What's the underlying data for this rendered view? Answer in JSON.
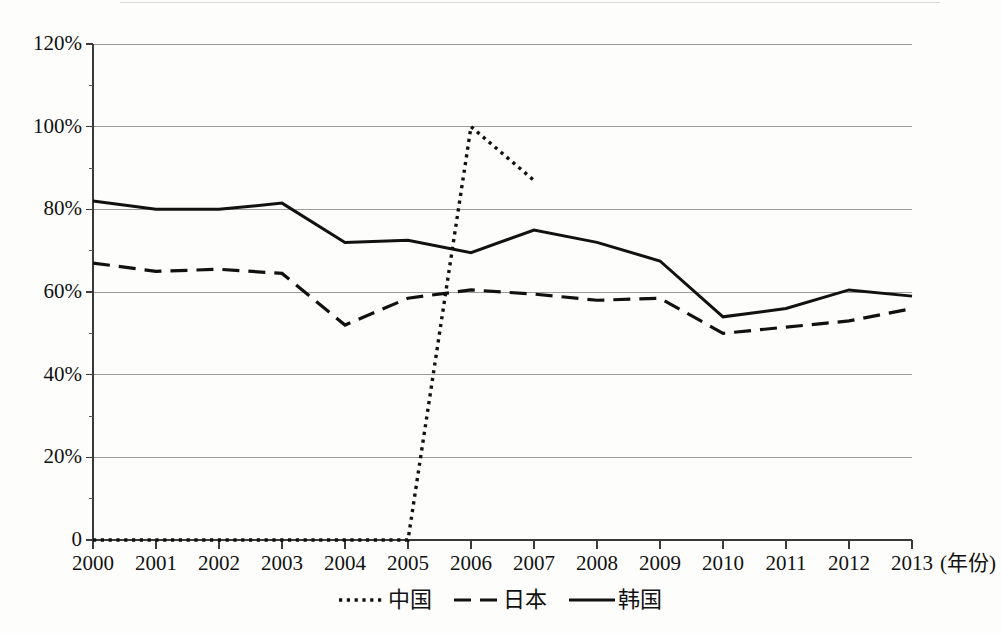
{
  "chart_data": {
    "type": "line",
    "title": "",
    "subtitle": "",
    "xlabel": "(年份)",
    "ylabel": "",
    "x": [
      2000,
      2001,
      2002,
      2003,
      2004,
      2005,
      2006,
      2007,
      2008,
      2009,
      2010,
      2011,
      2012,
      2013
    ],
    "categories": [
      "2000",
      "2001",
      "2002",
      "2003",
      "2004",
      "2005",
      "2006",
      "2007",
      "2008",
      "2009",
      "2010",
      "2011",
      "2012",
      "2013"
    ],
    "xlim": [
      2000,
      2013
    ],
    "ylim": [
      0,
      120
    ],
    "y_tick_labels": [
      "0",
      "20%",
      "40%",
      "60%",
      "80%",
      "100%",
      "120%"
    ],
    "y_tick_values": [
      0,
      20,
      40,
      60,
      80,
      100,
      120
    ],
    "grid": true,
    "grid_axis": "y",
    "legend_position": "bottom",
    "series": [
      {
        "name": "中国",
        "line_style": "dotted",
        "color": "#111111",
        "values": [
          0,
          0,
          0,
          0,
          0,
          0,
          100,
          87,
          null,
          null,
          null,
          null,
          null,
          null
        ]
      },
      {
        "name": "日本",
        "line_style": "dashed",
        "color": "#111111",
        "values": [
          67,
          65,
          65.5,
          64.5,
          52,
          58.5,
          60.5,
          59.5,
          58,
          58.5,
          50,
          51.5,
          53,
          56
        ]
      },
      {
        "name": "韩国",
        "line_style": "solid",
        "color": "#111111",
        "values": [
          82,
          80,
          80,
          81.5,
          72,
          72.5,
          69.5,
          75,
          72,
          67.5,
          54,
          56,
          60.5,
          59
        ]
      }
    ]
  },
  "axes": {
    "y_ticks": [
      {
        "label": "120%",
        "value": 120
      },
      {
        "label": "100%",
        "value": 100
      },
      {
        "label": "80%",
        "value": 80
      },
      {
        "label": "60%",
        "value": 60
      },
      {
        "label": "40%",
        "value": 40
      },
      {
        "label": "20%",
        "value": 20
      },
      {
        "label": "0",
        "value": 0
      }
    ],
    "x_ticks": [
      {
        "label": "2000"
      },
      {
        "label": "2001"
      },
      {
        "label": "2002"
      },
      {
        "label": "2003"
      },
      {
        "label": "2004"
      },
      {
        "label": "2005"
      },
      {
        "label": "2006"
      },
      {
        "label": "2007"
      },
      {
        "label": "2008"
      },
      {
        "label": "2009"
      },
      {
        "label": "2010"
      },
      {
        "label": "2011"
      },
      {
        "label": "2012"
      },
      {
        "label": "2013"
      }
    ],
    "x_axis_unit_label": "(年份)"
  },
  "legend": {
    "items": [
      {
        "label": "中国",
        "style": "dotted"
      },
      {
        "label": "日本",
        "style": "dashed"
      },
      {
        "label": "韩国",
        "style": "solid"
      }
    ]
  }
}
